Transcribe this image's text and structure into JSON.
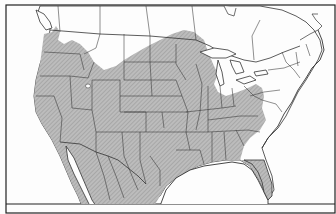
{
  "map": {
    "title": "",
    "region": "North America (United States, southern Canada, northern Mexico)",
    "legend": {
      "shaded": "Species range",
      "unshaded": "Outside range"
    },
    "colors": {
      "background": "#fdfdfd",
      "range_fill": "#b9b9b9",
      "hatch": "#8e8e8e",
      "border": "#222222",
      "state_lines": "#333333"
    },
    "caption": ""
  }
}
